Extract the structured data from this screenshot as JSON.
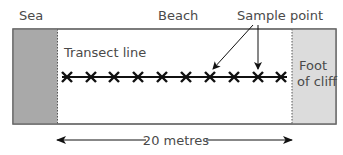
{
  "labels": {
    "sea": "Sea",
    "beach": "Beach",
    "sample_point": "Sample point",
    "transect_line": "Transect line",
    "foot_of_cliff_line1": "Foot",
    "foot_of_cliff_line2": "of cliff",
    "distance": "20 metres"
  },
  "colors": {
    "sea_fill": "#a9a9a9",
    "beach_fill": "#ffffff",
    "cliff_fill": "#dcdcdc",
    "border": "#6a6a6a",
    "line": "#111111",
    "text": "#4a4a4a"
  },
  "transect": {
    "sample_point_count": 10,
    "sample_points_x": [
      67,
      91,
      114,
      138,
      162,
      186,
      210,
      234,
      258,
      281
    ]
  }
}
